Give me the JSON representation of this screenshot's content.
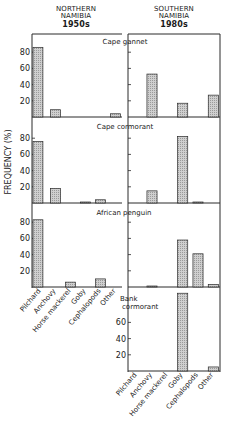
{
  "headers": {
    "left": {
      "region_line1": "NORTHERN",
      "region_line2": "NAMIBIA",
      "era": "1950s"
    },
    "right": {
      "region_line1": "SOUTHERN",
      "region_line2": "NAMIBIA",
      "era": "1980s"
    }
  },
  "ylabel": "FREQUENCY (%)",
  "chart_data": {
    "type": "bar",
    "xlabel": "",
    "ylabel": "FREQUENCY (%)",
    "ylim": [
      0,
      100
    ],
    "yticks": [
      20,
      40,
      60,
      80
    ],
    "categories": [
      "Pilchard",
      "Anchovy",
      "Horse mackerel",
      "Goby",
      "Cephalopods",
      "Other"
    ],
    "panels": [
      {
        "species": "Cape gannet",
        "region": "Northern Namibia 1950s",
        "values": [
          86,
          9,
          0,
          0,
          0,
          4
        ]
      },
      {
        "species": "Cape gannet",
        "region": "Southern Namibia 1980s",
        "values": [
          0,
          53,
          0,
          17,
          0,
          27
        ]
      },
      {
        "species": "Cape cormorant",
        "region": "Northern Namibia 1950s",
        "values": [
          76,
          18,
          0,
          1,
          4,
          0
        ]
      },
      {
        "species": "Cape cormorant",
        "region": "Southern Namibia 1980s",
        "values": [
          0,
          15,
          0,
          82,
          1,
          0
        ]
      },
      {
        "species": "African penguin",
        "region": "Northern Namibia 1950s",
        "values": [
          83,
          0,
          6,
          0,
          10,
          0
        ]
      },
      {
        "species": "African penguin",
        "region": "Southern Namibia 1980s",
        "values": [
          0,
          1,
          0,
          58,
          41,
          3
        ]
      },
      {
        "species": "Bank cormorant",
        "region": "Southern Namibia 1980s",
        "values": [
          0,
          0,
          0,
          96,
          0,
          5
        ]
      }
    ],
    "species_labels": [
      "Cape gannet",
      "Cape cormorant",
      "African penguin",
      "Bank cormorant"
    ],
    "grid": false,
    "legend": "none",
    "bar_fill": "#cfcfcf",
    "bar_stroke": "#333333"
  }
}
